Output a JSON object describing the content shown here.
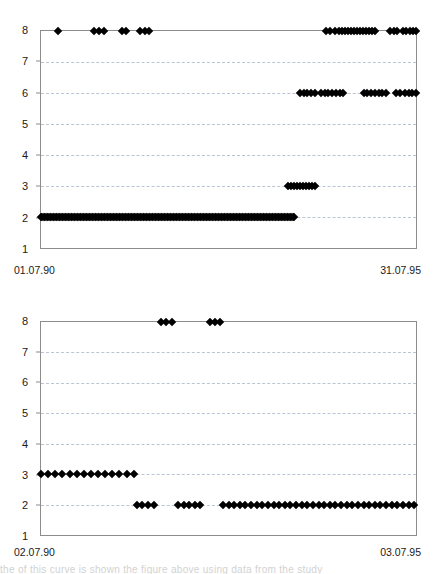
{
  "page": {
    "background": "#ffffff",
    "marker_color": "#000000",
    "frame_color": "#8c8c8c",
    "gridline_color": "#b9c4d4",
    "bottom_cut_text": "the of this curve is shown the figure above using data from the study"
  },
  "chart_data": [
    {
      "id": "top",
      "type": "scatter",
      "title": "",
      "subtitle": "",
      "xlabel": "",
      "ylabel": "",
      "grid": true,
      "legend": "none",
      "ylim": [
        1,
        8
      ],
      "yticks": [
        8,
        7,
        6,
        5,
        4,
        3,
        2,
        1
      ],
      "ytick_labels": [
        "8",
        "7",
        "6",
        "5",
        "4",
        "3",
        "2",
        "1"
      ],
      "xlim_labels": [
        "01.07.90",
        "31.07.95"
      ],
      "x_start_label": "01.07.90",
      "x_end_label": "31.07.95",
      "series": [
        {
          "name": "level-8",
          "y": 8,
          "x_percent": [
            4.5,
            14.0,
            15.4,
            16.8,
            21.6,
            22.6,
            26.4,
            27.6,
            28.8,
            76.0,
            77.2,
            78.3,
            79.4,
            80.2,
            81.0,
            81.8,
            82.6,
            83.4,
            84.2,
            85.0,
            85.8,
            86.6,
            87.4,
            88.2,
            89.0,
            93.0,
            94.0,
            95.0,
            96.4,
            97.4,
            98.3,
            99.2,
            100.0
          ]
        },
        {
          "name": "level-6",
          "y": 6,
          "x_percent": [
            69.0,
            70.0,
            71.0,
            72.0,
            73.2,
            74.6,
            75.6,
            76.6,
            77.6,
            78.6,
            79.6,
            80.6,
            86.0,
            87.0,
            88.0,
            89.0,
            90.0,
            91.0,
            92.0,
            94.6,
            95.6,
            97.0,
            98.0,
            99.0,
            100.0
          ]
        },
        {
          "name": "level-3",
          "y": 3,
          "x_percent": [
            65.8,
            66.6,
            67.4,
            68.2,
            69.0,
            69.8,
            70.6,
            71.4,
            72.2,
            73.0
          ]
        },
        {
          "name": "level-2",
          "y": 2,
          "x_percent_range": [
            0.0,
            67.5
          ],
          "density": 170
        }
      ]
    },
    {
      "id": "bottom",
      "type": "scatter",
      "title": "",
      "subtitle": "",
      "xlabel": "",
      "ylabel": "",
      "grid": true,
      "legend": "none",
      "ylim": [
        1,
        8
      ],
      "yticks": [
        8,
        7,
        6,
        5,
        4,
        3,
        2,
        1
      ],
      "ytick_labels": [
        "8",
        "7",
        "6",
        "5",
        "4",
        "3",
        "2",
        "1"
      ],
      "xlim_labels": [
        "02.07.90",
        "03.07.95"
      ],
      "x_start_label": "02.07.90",
      "x_end_label": "03.07.95",
      "series": [
        {
          "name": "level-8",
          "y": 8,
          "x_percent": [
            32.0,
            33.4,
            34.8,
            45.0,
            46.4,
            47.8
          ]
        },
        {
          "name": "level-3",
          "y": 3,
          "x_percent": [
            0.0,
            1.9,
            3.8,
            5.7,
            7.6,
            9.5,
            11.4,
            13.3,
            15.2,
            17.1,
            19.0,
            20.9,
            22.8,
            24.7
          ]
        },
        {
          "name": "level-2",
          "y": 2,
          "x_percent": [
            25.5,
            27.0,
            28.5,
            30.0,
            36.5,
            38.0,
            39.5,
            41.0,
            42.5,
            48.5,
            50.0,
            51.5,
            53.0,
            54.5,
            56.0,
            57.5,
            59.0,
            60.5,
            62.0,
            63.5,
            65.0,
            66.5,
            68.0,
            69.5,
            71.0,
            72.5,
            74.0,
            75.5,
            77.0,
            78.5,
            80.0,
            81.5,
            83.0,
            84.5,
            86.0,
            87.5,
            89.0,
            90.5,
            92.0,
            93.5,
            95.0,
            96.5,
            98.0,
            99.5
          ]
        }
      ]
    }
  ]
}
